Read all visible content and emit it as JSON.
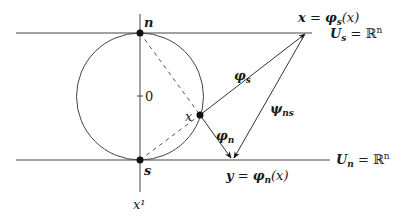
{
  "diagram": {
    "points": {
      "north": {
        "label": "n",
        "x": 140,
        "y": 33
      },
      "south": {
        "label": "s",
        "x": 140,
        "y": 160
      },
      "point_x": {
        "label": "x",
        "x": 200,
        "y": 115
      }
    },
    "axis": {
      "zero_label": "0",
      "axis_label": "x¹"
    },
    "planes": {
      "top": {
        "label": "U_s = ℝⁿ",
        "label_main": "U",
        "label_sub": "s",
        "label_rest": " = ℝ",
        "label_sup": "n"
      },
      "bottom": {
        "label": "U_n = ℝⁿ",
        "label_main": "U",
        "label_sub": "n",
        "label_rest": " = ℝ",
        "label_sup": "n"
      }
    },
    "images": {
      "top": {
        "lhs": "x",
        "eq": " = ",
        "map": "φ",
        "map_sub": "s",
        "arg": "(x)"
      },
      "bottom": {
        "lhs": "y",
        "eq": " = ",
        "map": "φ",
        "map_sub": "n",
        "arg": "(x)"
      }
    },
    "maps": {
      "phi_s": {
        "sym": "φ",
        "sub": "s"
      },
      "phi_n": {
        "sym": "φ",
        "sub": "n"
      },
      "psi_ns": {
        "sym": "ψ",
        "sub": "ns"
      }
    },
    "colors": {
      "stroke": "#333333",
      "dot": "#111111"
    }
  }
}
